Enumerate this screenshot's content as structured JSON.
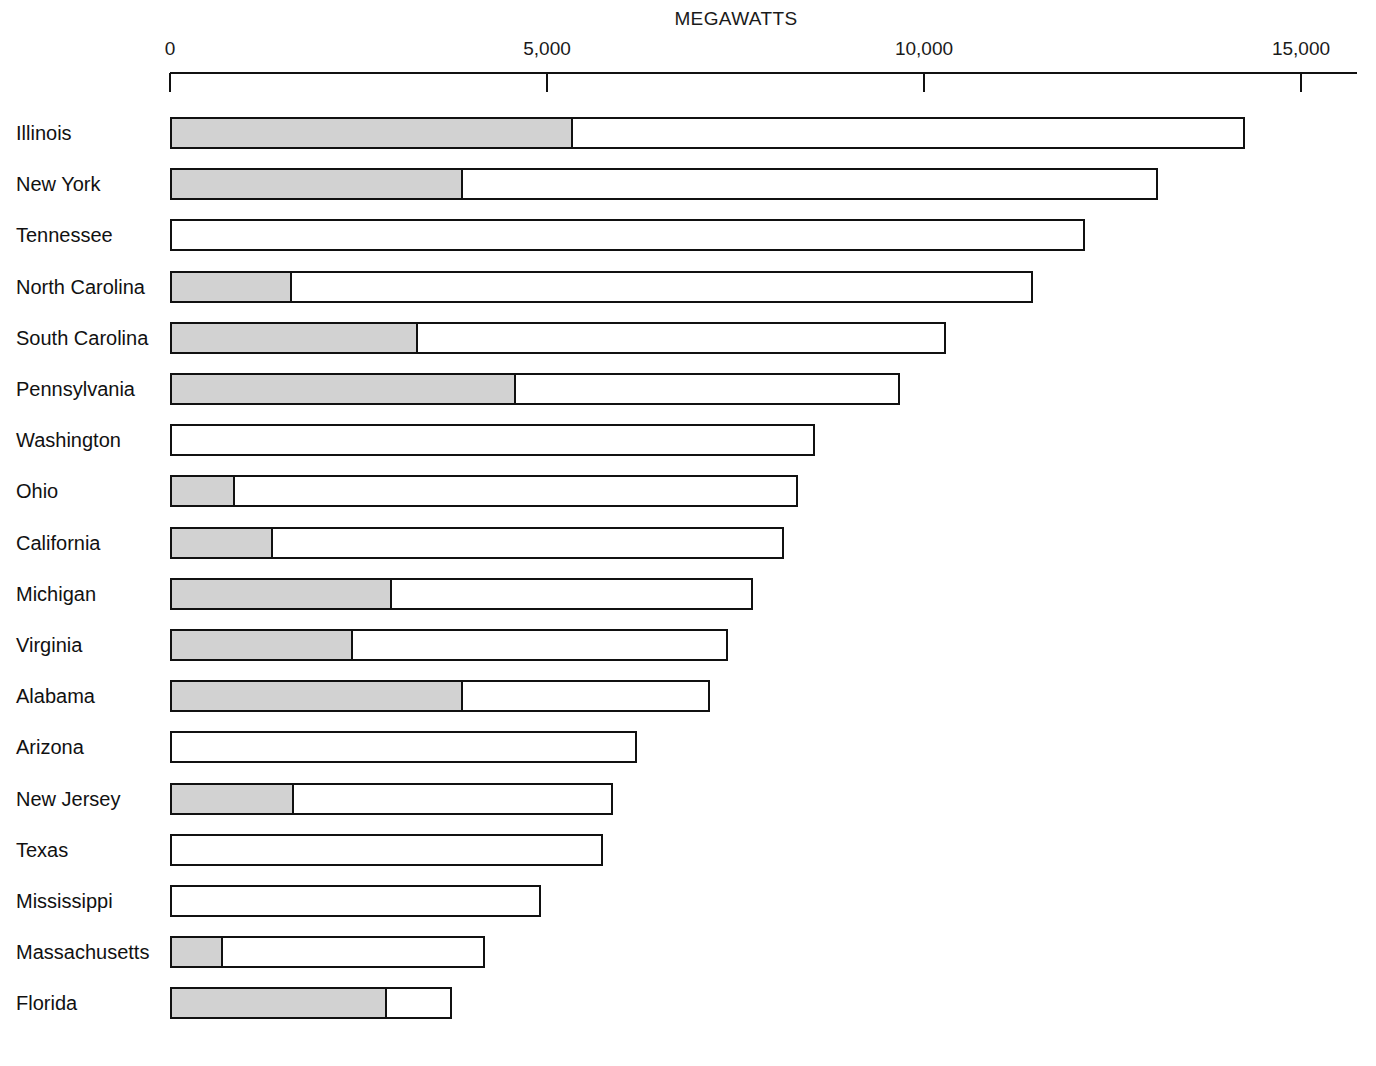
{
  "chart_data": {
    "type": "bar",
    "orientation": "horizontal",
    "title": "MEGAWATTS",
    "xlabel": "MEGAWATTS",
    "ylabel": "",
    "xlim": [
      0,
      15750
    ],
    "grid": false,
    "legend": null,
    "axis_ticks": [
      {
        "value": 0,
        "label": "0"
      },
      {
        "value": 5000,
        "label": "5,000"
      },
      {
        "value": 10000,
        "label": "10,000"
      },
      {
        "value": 15000,
        "label": "15,000"
      }
    ],
    "categories": [
      "Illinois",
      "New York",
      "Tennessee",
      "North Carolina",
      "South Carolina",
      "Pennsylvania",
      "Washington",
      "Ohio",
      "California",
      "Michigan",
      "Virginia",
      "Alabama",
      "Arizona",
      "New Jersey",
      "Texas",
      "Mississippi",
      "Massachusetts",
      "Florida"
    ],
    "series": [
      {
        "name": "shaded",
        "values": [
          5350,
          3890,
          0,
          1620,
          3290,
          4600,
          0,
          875,
          1370,
          2945,
          2440,
          3890,
          0,
          1645,
          0,
          0,
          705,
          2880
        ]
      },
      {
        "name": "total",
        "values": [
          14260,
          13100,
          12140,
          11450,
          10290,
          9680,
          8550,
          8330,
          8140,
          7730,
          7400,
          7160,
          6195,
          5875,
          5740,
          4920,
          4180,
          3740
        ]
      }
    ],
    "rows": [
      {
        "label": "Illinois",
        "total": 14260,
        "shaded": 5350
      },
      {
        "label": "New York",
        "total": 13100,
        "shaded": 3890
      },
      {
        "label": "Tennessee",
        "total": 12140,
        "shaded": 0
      },
      {
        "label": "North Carolina",
        "total": 11450,
        "shaded": 1620
      },
      {
        "label": "South Carolina",
        "total": 10290,
        "shaded": 3290
      },
      {
        "label": "Pennsylvania",
        "total": 9680,
        "shaded": 4600
      },
      {
        "label": "Washington",
        "total": 8550,
        "shaded": 0
      },
      {
        "label": "Ohio",
        "total": 8330,
        "shaded": 875
      },
      {
        "label": "California",
        "total": 8140,
        "shaded": 1370
      },
      {
        "label": "Michigan",
        "total": 7730,
        "shaded": 2945
      },
      {
        "label": "Virginia",
        "total": 7400,
        "shaded": 2440
      },
      {
        "label": "Alabama",
        "total": 7160,
        "shaded": 3890
      },
      {
        "label": "Arizona",
        "total": 6195,
        "shaded": 0
      },
      {
        "label": "New Jersey",
        "total": 5875,
        "shaded": 1645
      },
      {
        "label": "Texas",
        "total": 5740,
        "shaded": 0
      },
      {
        "label": "Mississippi",
        "total": 4920,
        "shaded": 0
      },
      {
        "label": "Massachusetts",
        "total": 4180,
        "shaded": 705
      },
      {
        "label": "Florida",
        "total": 3740,
        "shaded": 2880
      }
    ]
  },
  "colors": {
    "bar_outline": "#111111",
    "bar_fill_shaded": "#d2d2d2",
    "bar_fill_open": "#ffffff",
    "text": "#111111",
    "background": "#ffffff"
  }
}
